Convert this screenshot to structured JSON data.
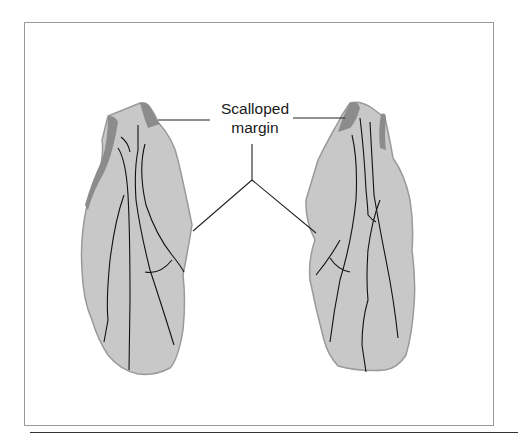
{
  "figure": {
    "label_line1": "Scalloped",
    "label_line2": "margin",
    "colors": {
      "leaf_fill": "#c8c8c8",
      "margin_fill": "#8c8c8c",
      "vein": "#111111",
      "frame": "#9a9a9a"
    },
    "elements": [
      "left-wing",
      "right-wing",
      "callout-lines"
    ]
  }
}
